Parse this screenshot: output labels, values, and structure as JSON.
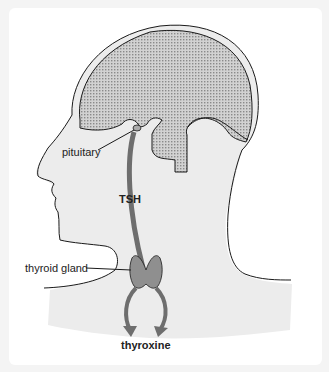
{
  "figure": {
    "colors": {
      "background": "#ffffff",
      "skin": "#ececec",
      "outline": "#1a1a1a",
      "brain_fill": "#b9b9b9",
      "hormone_arrow": "#6e6e6e",
      "thyroid_fill": "#8f8f8f"
    },
    "labels": {
      "pituitary": "pituitary",
      "tsh": "TSH",
      "thyroid_gland": "thyroid gland",
      "thyroxine": "thyroxine"
    }
  }
}
